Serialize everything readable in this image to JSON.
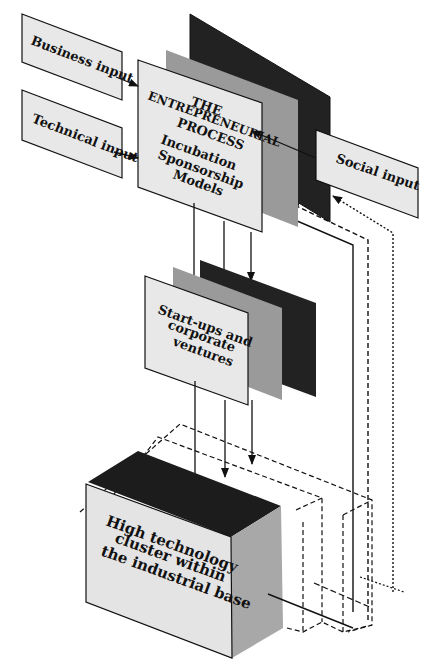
{
  "diagram": {
    "inputs": {
      "business": "Business input",
      "technical": "Technical input",
      "social": "Social input"
    },
    "process": {
      "line1": "THE",
      "line2": "ENTREPRENEURIAL",
      "line3": "PROCESS",
      "line4": "Incubation",
      "line5": "Sponsorship",
      "line6": "Models"
    },
    "ventures": {
      "line1": "Start-ups and",
      "line2": "corporate",
      "line3": "ventures"
    },
    "cluster": {
      "line1": "High technology",
      "line2": "cluster within",
      "line3": "the industrial base"
    },
    "colors": {
      "panel_light": "#e8e8e8",
      "panel_mid": "#9a9a9a",
      "panel_dark": "#222222",
      "stroke": "#111111"
    }
  }
}
